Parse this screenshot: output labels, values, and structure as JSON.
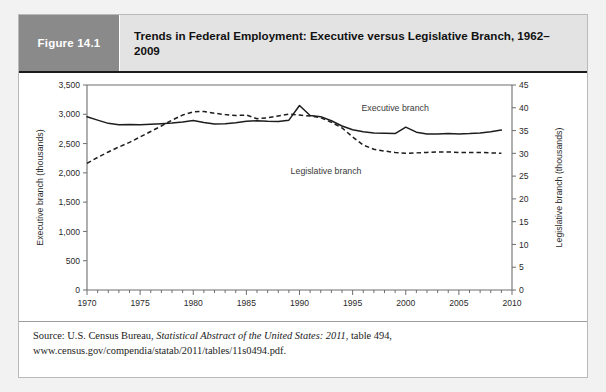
{
  "figure": {
    "label": "Figure 14.1",
    "title": "Trends in Federal Employment: Executive versus Legislative Branch, 1962–2009",
    "label_bg": "#8a8a8a",
    "title_bg": "#e3e3e3"
  },
  "source": {
    "prefix": "Source: U.S. Census Bureau, ",
    "italic": "Statistical Abstract of the United States: 2011",
    "suffix": ", table 494, www.census.gov/compendia/statab/2011/tables/11s0494.pdf."
  },
  "chart_data": {
    "type": "line",
    "title": "Trends in Federal Employment: Executive versus Legislative Branch, 1962–2009",
    "xlabel": "",
    "ylabel": "Executive branch (thousands)",
    "y2label": "Legislative branch (thousands)",
    "xlim": [
      1970,
      2010
    ],
    "ylim": [
      0,
      3500
    ],
    "y2lim": [
      0,
      45
    ],
    "xticks": [
      1970,
      1975,
      1980,
      1985,
      1990,
      1995,
      2000,
      2005,
      2010
    ],
    "xtick_labels": [
      "1970",
      "1975",
      "1980",
      "1985",
      "1990",
      "1995",
      "2000",
      "2005",
      "2010"
    ],
    "xminor_step": 1,
    "yticks": [
      0,
      500,
      1000,
      1500,
      2000,
      2500,
      3000,
      3500
    ],
    "ytick_labels": [
      "0",
      "500",
      "1,000",
      "1,500",
      "2,000",
      "2,500",
      "3,000",
      "3,500"
    ],
    "y2ticks": [
      0,
      5,
      10,
      15,
      20,
      25,
      30,
      35,
      40,
      45
    ],
    "y2tick_labels": [
      "0",
      "5",
      "10",
      "15",
      "20",
      "25",
      "30",
      "35",
      "40",
      "45"
    ],
    "grid": false,
    "legend_position": "inline-annotations",
    "x": [
      1970,
      1971,
      1972,
      1973,
      1974,
      1975,
      1976,
      1977,
      1978,
      1979,
      1980,
      1981,
      1982,
      1983,
      1984,
      1985,
      1986,
      1987,
      1988,
      1989,
      1990,
      1991,
      1992,
      1993,
      1994,
      1995,
      1996,
      1997,
      1998,
      1999,
      2000,
      2001,
      2002,
      2003,
      2004,
      2005,
      2006,
      2007,
      2008,
      2009
    ],
    "series": [
      {
        "name": "Executive branch",
        "axis": "left",
        "style": "solid",
        "units": "thousands",
        "values": [
          2958,
          2900,
          2845,
          2820,
          2825,
          2820,
          2830,
          2840,
          2850,
          2870,
          2895,
          2860,
          2835,
          2840,
          2855,
          2880,
          2890,
          2880,
          2875,
          2900,
          3150,
          2980,
          2960,
          2890,
          2800,
          2735,
          2700,
          2680,
          2675,
          2670,
          2780,
          2695,
          2665,
          2665,
          2670,
          2665,
          2670,
          2680,
          2700,
          2730
        ]
      },
      {
        "name": "Legislative branch",
        "axis": "right",
        "style": "dashed",
        "units": "thousands",
        "values": [
          27.8,
          29.1,
          30.3,
          31.4,
          32.4,
          33.6,
          34.8,
          36.0,
          37.3,
          38.4,
          39.1,
          39.2,
          38.8,
          38.5,
          38.3,
          38.4,
          37.6,
          37.8,
          38.2,
          38.6,
          38.4,
          38.2,
          37.8,
          36.8,
          35.6,
          33.6,
          31.8,
          30.9,
          30.5,
          30.2,
          30.0,
          30.1,
          30.2,
          30.3,
          30.3,
          30.2,
          30.2,
          30.2,
          30.1,
          30.0
        ]
      }
    ],
    "annotations": [
      {
        "text": "Executive branch",
        "x": 1999,
        "y": 3050
      },
      {
        "text": "Legislative branch",
        "x": 1992.5,
        "y": 1980
      }
    ]
  }
}
